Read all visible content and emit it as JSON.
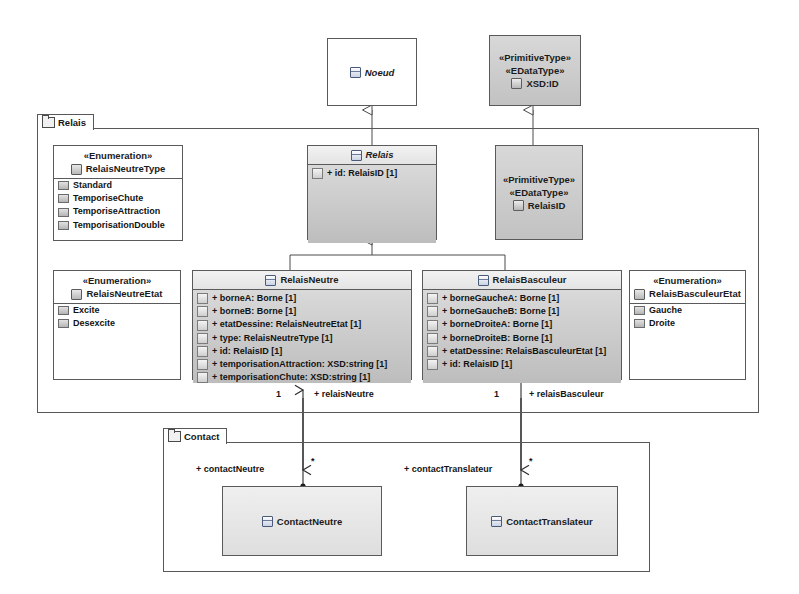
{
  "diagram": {
    "type": "uml-class-diagram"
  },
  "packages": [
    {
      "id": "relais",
      "label": "Relais",
      "icon": "package-icon"
    },
    {
      "id": "contact",
      "label": "Contact",
      "icon": "package-icon"
    }
  ],
  "classes": {
    "noeud": {
      "name": "Noeud",
      "abstract": true,
      "icon": "class-icon",
      "fill": "white"
    },
    "xsdid": {
      "stereotypes": [
        "«PrimitiveType»",
        "«EDataType»"
      ],
      "name": "XSD:ID",
      "icon": "datatype-icon",
      "fill": "grey"
    },
    "relais": {
      "name": "Relais",
      "abstract": true,
      "icon": "class-icon",
      "fill": "grey",
      "attributes": [
        {
          "text": "+ id: RelaisID [1]",
          "icon": "attribute-icon"
        }
      ]
    },
    "relaisid": {
      "stereotypes": [
        "«PrimitiveType»",
        "«EDataType»"
      ],
      "name": "RelaisID",
      "icon": "datatype-icon",
      "fill": "grey"
    },
    "relaisNeutreType": {
      "stereotype": "«Enumeration»",
      "name": "RelaisNeutreType",
      "icon": "enum-icon",
      "fill": "white",
      "literals": [
        {
          "text": "Standard",
          "icon": "literal-icon"
        },
        {
          "text": "TemporiseChute",
          "icon": "literal-icon"
        },
        {
          "text": "TemporiseAttraction",
          "icon": "literal-icon"
        },
        {
          "text": "TemporisationDouble",
          "icon": "literal-icon"
        }
      ]
    },
    "relaisNeutreEtat": {
      "stereotype": "«Enumeration»",
      "name": "RelaisNeutreEtat",
      "icon": "enum-icon",
      "fill": "white",
      "literals": [
        {
          "text": "Excite",
          "icon": "literal-icon"
        },
        {
          "text": "Desexcite",
          "icon": "literal-icon"
        }
      ]
    },
    "relaisBasculeurEtat": {
      "stereotype": "«Enumeration»",
      "name": "RelaisBasculeurEtat",
      "icon": "enum-icon",
      "fill": "white",
      "literals": [
        {
          "text": "Gauche",
          "icon": "literal-icon"
        },
        {
          "text": "Droite",
          "icon": "literal-icon"
        }
      ]
    },
    "relaisNeutre": {
      "name": "RelaisNeutre",
      "abstract": false,
      "icon": "class-icon",
      "fill": "grey",
      "attributes": [
        {
          "text": "+ borneA: Borne [1]",
          "icon": "attribute-icon"
        },
        {
          "text": "+ borneB: Borne [1]",
          "icon": "attribute-icon"
        },
        {
          "text": "+ etatDessine: RelaisNeutreEtat [1]",
          "icon": "attribute-icon"
        },
        {
          "text": "+ type: RelaisNeutreType [1]",
          "icon": "attribute-icon"
        },
        {
          "text": "+ id: RelaisID [1]",
          "icon": "attribute-icon"
        },
        {
          "text": "+ temporisationAttraction: XSD:string [1]",
          "icon": "attribute-icon"
        },
        {
          "text": "+ temporisationChute: XSD:string [1]",
          "icon": "attribute-icon"
        }
      ]
    },
    "relaisBasculeur": {
      "name": "RelaisBasculeur",
      "abstract": false,
      "icon": "class-icon",
      "fill": "grey",
      "attributes": [
        {
          "text": "+ borneGaucheA: Borne [1]",
          "icon": "attribute-icon"
        },
        {
          "text": "+ borneGaucheB: Borne [1]",
          "icon": "attribute-icon"
        },
        {
          "text": "+ borneDroiteA: Borne [1]",
          "icon": "attribute-icon"
        },
        {
          "text": "+ borneDroiteB: Borne [1]",
          "icon": "attribute-icon"
        },
        {
          "text": "+ etatDessine: RelaisBasculeurEtat [1]",
          "icon": "attribute-icon"
        },
        {
          "text": "+ id: RelaisID [1]",
          "icon": "attribute-icon"
        }
      ]
    },
    "contactNeutre": {
      "name": "ContactNeutre",
      "icon": "class-icon",
      "fill": "light"
    },
    "contactTranslateur": {
      "name": "ContactTranslateur",
      "icon": "class-icon",
      "fill": "light"
    }
  },
  "edges": {
    "relaisNeutre_assoc": {
      "source_multiplicity": "1",
      "source_role": "+ relaisNeutre",
      "target_multiplicity": "*",
      "target_role": "+ contactNeutre"
    },
    "relaisBasculeur_assoc": {
      "source_multiplicity": "1",
      "source_role": "+ relaisBasculeur",
      "target_multiplicity": "*",
      "target_role": "+ contactTranslateur"
    }
  },
  "colors": {
    "line": "#58585a",
    "class_fill_dark": "#c8c8c8",
    "class_fill_light": "#e4e4e4",
    "background": "#ffffff"
  }
}
